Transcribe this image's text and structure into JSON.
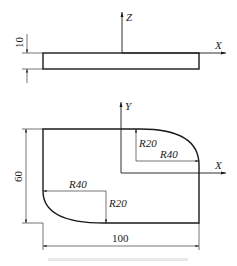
{
  "figure": {
    "top_view": {
      "axis_vertical_label": "Z",
      "axis_horizontal_label": "X",
      "thickness_dim": "10"
    },
    "plan_view": {
      "axis_vertical_label": "Y",
      "axis_horizontal_label": "X",
      "height_dim": "60",
      "width_dim": "100",
      "top_right_fillet": {
        "radius_y_label": "R20",
        "radius_x_label": "R40"
      },
      "bottom_left_fillet": {
        "radius_x_label": "R40",
        "radius_y_label": "R20"
      }
    },
    "caption": ""
  },
  "colors": {
    "line": "#1a1a1a",
    "background": "#ffffff"
  }
}
